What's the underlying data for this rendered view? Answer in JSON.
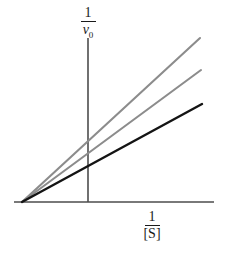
{
  "figure": {
    "background_color": "#ffffff"
  },
  "labels": {
    "y_axis": {
      "numerator": "1",
      "denominator_symbol": "v",
      "denominator_subscript": "0",
      "full": "1/v0"
    },
    "x_axis": {
      "numerator": "1",
      "denominator": "[S]",
      "full": "1/[S]"
    }
  },
  "chart_data": {
    "type": "line",
    "title": "",
    "xlabel": "1/[S]",
    "ylabel": "1/v0",
    "grid": false,
    "legend": null,
    "axis_style": "two-axis-cross, x-axis horizontal rule, y-axis vertical rule",
    "xlim": [
      -0.11,
      1.0
    ],
    "ylim": [
      0,
      1.0
    ],
    "axes_pixels": {
      "x_axis_y": 202,
      "x_axis_x_start": 14,
      "x_axis_x_end": 214,
      "y_axis_x": 88,
      "y_axis_y_top": 38,
      "y_axis_y_bottom": 202
    },
    "common_intersection": {
      "x_pixel": 22,
      "y_pixel": 202,
      "note": "all three lines converge on the x-axis left of the origin (-1/Km)"
    },
    "series": [
      {
        "name": "line-steepest",
        "color": "#8c8c8c",
        "width": 2.1,
        "points_pixel": [
          [
            22,
            202
          ],
          [
            200,
            38
          ]
        ],
        "slope_description": "steepest gray line, highest apparent Km"
      },
      {
        "name": "line-intermediate",
        "color": "#8c8c8c",
        "width": 2.1,
        "points_pixel": [
          [
            22,
            202
          ],
          [
            201,
            70
          ]
        ],
        "slope_description": "intermediate gray line"
      },
      {
        "name": "line-uninhibited",
        "color": "#141414",
        "width": 2.4,
        "points_pixel": [
          [
            22,
            202
          ],
          [
            202,
            104
          ]
        ],
        "slope_description": "shallowest black line, no inhibitor"
      }
    ]
  },
  "colors": {
    "axis": "#4d4d4d",
    "gray_line": "#8c8c8c",
    "black_line": "#141414",
    "text": "#1a1a1a"
  }
}
